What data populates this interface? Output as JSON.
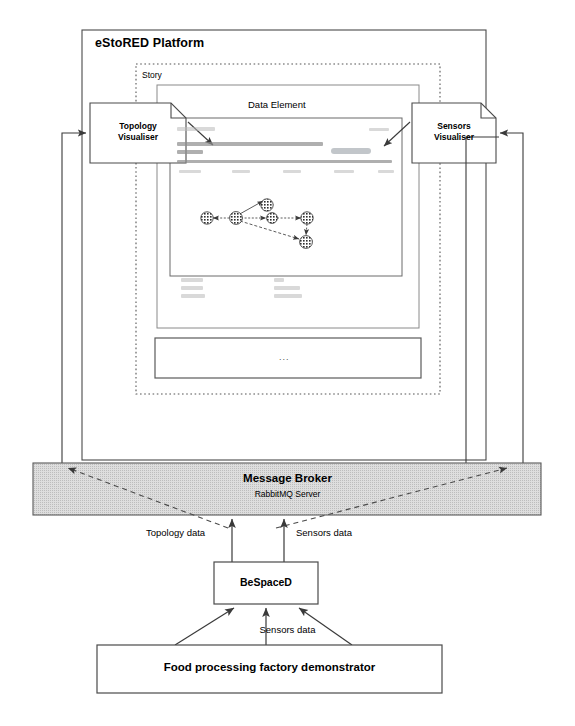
{
  "diagram": {
    "platform": {
      "label": "eStoRED Platform"
    },
    "story": {
      "label": "Story"
    },
    "data_element": {
      "label": "Data Element",
      "ellipsis_box_label": "..."
    },
    "notes": [
      {
        "name": "topology-visualiser",
        "line1": "Topology",
        "line2": "Visualiser"
      },
      {
        "name": "sensors-visualiser",
        "line1": "Sensors",
        "line2": "Visualiser"
      }
    ],
    "message_broker": {
      "title": "Message Broker",
      "subtitle": "RabbitMQ Server"
    },
    "bespaced": {
      "label": "BeSpaceD"
    },
    "factory": {
      "label": "Food processing factory demonstrator"
    },
    "flows": [
      {
        "name": "topology-data-flow",
        "label": "Topology data"
      },
      {
        "name": "sensors-data-flow",
        "label": "Sensors data"
      },
      {
        "name": "factory-sensors-data-flow",
        "label": "Sensors data"
      }
    ],
    "graph": {
      "type": "node-link",
      "nodes": [
        {
          "id": "n1",
          "x": 207,
          "y": 218
        },
        {
          "id": "n2",
          "x": 236,
          "y": 218
        },
        {
          "id": "n3",
          "x": 267,
          "y": 208
        },
        {
          "id": "n4",
          "x": 272,
          "y": 219
        },
        {
          "id": "n5",
          "x": 307,
          "y": 218
        },
        {
          "id": "n6",
          "x": 305,
          "y": 242
        }
      ],
      "edges": [
        {
          "from": "n2",
          "to": "n1"
        },
        {
          "from": "n2",
          "to": "n3"
        },
        {
          "from": "n2",
          "to": "n4"
        },
        {
          "from": "n4",
          "to": "n5"
        },
        {
          "from": "n2",
          "to": "n6"
        },
        {
          "from": "n5",
          "to": "n6"
        }
      ]
    },
    "colors": {
      "stroke": "#4a4a4a",
      "broker_fill": "#d8d8d8",
      "page_bg": "#ffffff"
    }
  }
}
